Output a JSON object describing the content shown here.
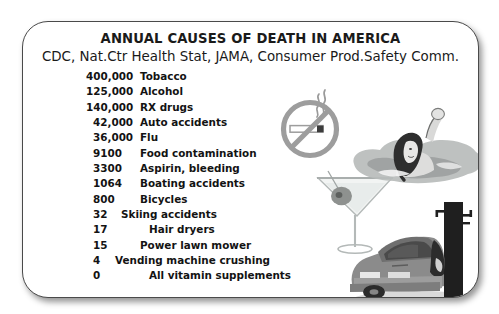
{
  "card": {
    "title": "ANNUAL CAUSES OF DEATH IN AMERICA",
    "subtitle": "CDC, Nat.Ctr Health Stat, JAMA, Consumer Prod.Safety Comm.",
    "columns": [
      "Deaths per year",
      "Cause"
    ],
    "rows": [
      {
        "count": "400,000",
        "cause": "Tobacco"
      },
      {
        "count": "125,000",
        "cause": "Alcohol"
      },
      {
        "count": "140,000",
        "cause": "RX drugs"
      },
      {
        "count": "42,000",
        "cause": "Auto accidents"
      },
      {
        "count": "36,000",
        "cause": "Flu"
      },
      {
        "count": "9100",
        "cause": "Food contamination"
      },
      {
        "count": "3300",
        "cause": "Aspirin, bleeding"
      },
      {
        "count": "1064",
        "cause": "Boating accidents"
      },
      {
        "count": "800",
        "cause": "Bicycles"
      },
      {
        "count": "32",
        "cause": "Skiing accidents"
      },
      {
        "count": "17",
        "cause": "Hair dryers"
      },
      {
        "count": "15",
        "cause": "Power lawn mower"
      },
      {
        "count": "4",
        "cause": "Vending machine crushing"
      },
      {
        "count": "0",
        "cause": "All vitamin supplements"
      }
    ]
  },
  "artwork": [
    {
      "name": "no-smoking-icon",
      "caption": "No smoking sign with lit cigarette"
    },
    {
      "name": "martini-glass-icon",
      "caption": "Martini glass with olive"
    },
    {
      "name": "drowning-swimmer-image",
      "caption": "Person in water with raised arm"
    },
    {
      "name": "car-crash-image",
      "caption": "Car wrecked against utility pole"
    }
  ],
  "colors": {
    "background": "#ffffff",
    "card_border": "#4a4a4a",
    "text": "#131313",
    "art_dark": "#3a3a3a",
    "art_mid": "#8c8c8c",
    "art_light": "#c9c9c9"
  }
}
